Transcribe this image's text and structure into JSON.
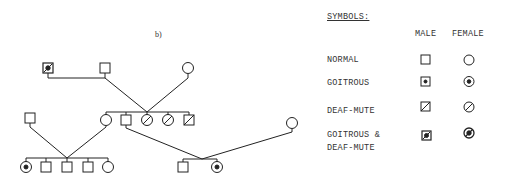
{
  "figure_label": "b)",
  "legend": {
    "title": "SYMBOLS:",
    "columns": [
      "MALE",
      "FEMALE"
    ],
    "rows": [
      {
        "label": "NORMAL",
        "male": "square-empty",
        "female": "circle-empty"
      },
      {
        "label": "GOITROUS",
        "male": "square-dot",
        "female": "circle-dot"
      },
      {
        "label": "DEAF-MUTE",
        "male": "square-slash",
        "female": "circle-slash"
      },
      {
        "label": "GOITROUS &",
        "label2": "DEAF-MUTE",
        "male": "square-dot-slash",
        "female": "circle-dot-slash"
      }
    ]
  },
  "pedigree": {
    "generation_1": [
      {
        "sex": "male",
        "status": "goitrous-deaf-mute"
      },
      {
        "sex": "male",
        "status": "normal"
      },
      {
        "sex": "female",
        "status": "normal"
      }
    ],
    "generation_2": [
      {
        "sex": "male",
        "status": "normal",
        "role": "spouse"
      },
      {
        "sex": "female",
        "status": "normal"
      },
      {
        "sex": "male",
        "status": "normal"
      },
      {
        "sex": "female",
        "status": "deaf-mute"
      },
      {
        "sex": "female",
        "status": "deaf-mute"
      },
      {
        "sex": "male",
        "status": "deaf-mute"
      },
      {
        "sex": "female",
        "status": "normal",
        "role": "spouse"
      }
    ],
    "generation_3_left": [
      {
        "sex": "female",
        "status": "goitrous"
      },
      {
        "sex": "male",
        "status": "normal"
      },
      {
        "sex": "male",
        "status": "normal"
      },
      {
        "sex": "male",
        "status": "normal"
      },
      {
        "sex": "female",
        "status": "normal"
      }
    ],
    "generation_3_right": [
      {
        "sex": "male",
        "status": "normal"
      },
      {
        "sex": "female",
        "status": "goitrous"
      }
    ]
  },
  "colors": {
    "ink": "#222222",
    "background": "#ffffff"
  }
}
